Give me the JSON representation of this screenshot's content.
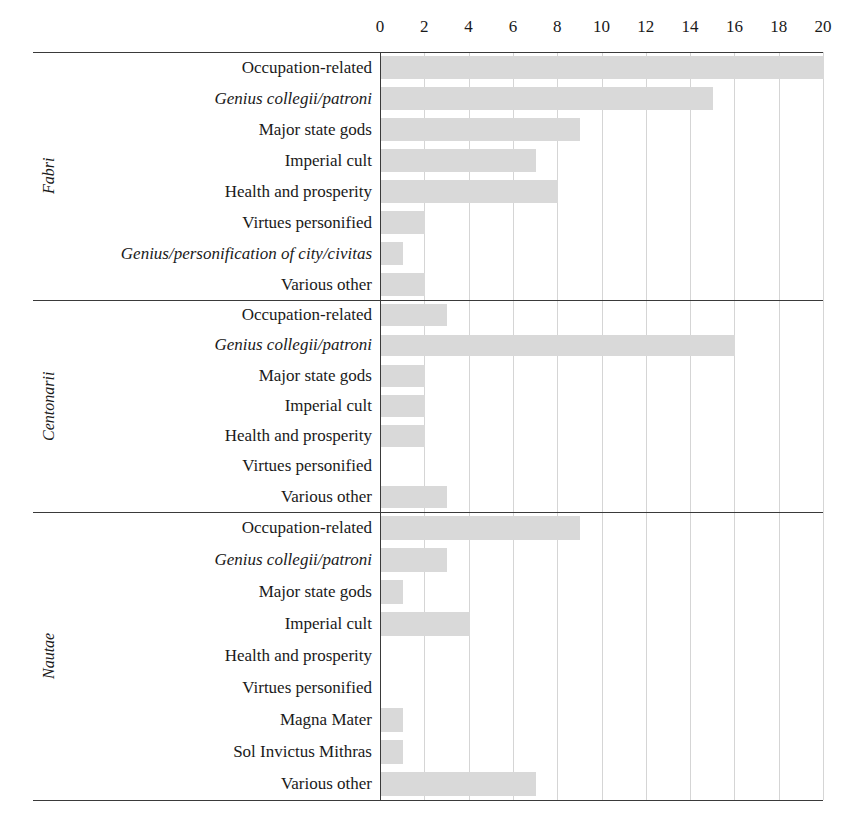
{
  "chart_data": {
    "type": "bar",
    "orientation": "horizontal",
    "title": "",
    "xlabel": "",
    "ylabel": "",
    "xlim": [
      0,
      20
    ],
    "xticks": [
      0,
      2,
      4,
      6,
      8,
      10,
      12,
      14,
      16,
      18,
      20
    ],
    "xtick_labels": [
      "0",
      "2",
      "4",
      "6",
      "8",
      "10",
      "12",
      "14",
      "16",
      "18",
      "20"
    ],
    "grid": "vertical-only",
    "legend": "none",
    "bar_color": "#d9d9d9",
    "groups": [
      {
        "name": "Fabri",
        "italic": true,
        "categories": [
          "Occupation-related",
          "Genius collegii/patroni",
          "Major state gods",
          "Imperial cult",
          "Health and prosperity",
          "Virtues personified",
          "Genius/personification of city/civitas",
          "Various other"
        ],
        "italic_categories": [
          false,
          true,
          false,
          false,
          false,
          false,
          true,
          false
        ],
        "values": [
          20,
          15,
          9,
          7,
          8,
          2,
          1,
          2
        ]
      },
      {
        "name": "Centonarii",
        "italic": true,
        "categories": [
          "Occupation-related",
          "Genius collegii/patroni",
          "Major state gods",
          "Imperial cult",
          "Health and prosperity",
          "Virtues personified",
          "Various other"
        ],
        "italic_categories": [
          false,
          true,
          false,
          false,
          false,
          false,
          false
        ],
        "values": [
          3,
          16,
          2,
          2,
          2,
          0,
          3
        ]
      },
      {
        "name": "Nautae",
        "italic": true,
        "categories": [
          "Occupation-related",
          "Genius collegii/patroni",
          "Major state gods",
          "Imperial cult",
          "Health and prosperity",
          "Virtues personified",
          "Magna Mater",
          "Sol Invictus Mithras",
          "Various other"
        ],
        "italic_categories": [
          false,
          true,
          false,
          false,
          false,
          false,
          false,
          false,
          false
        ],
        "values": [
          9,
          3,
          1,
          4,
          0,
          0,
          1,
          1,
          7
        ]
      }
    ]
  }
}
